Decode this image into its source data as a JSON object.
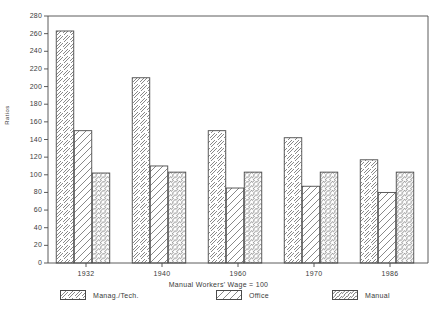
{
  "chart_data": {
    "type": "bar",
    "title": "",
    "xlabel": "Manual Workers' Wage = 100",
    "ylabel": "Ratios",
    "categories": [
      "1932",
      "1940",
      "1960",
      "1970",
      "1986"
    ],
    "series": [
      {
        "name": "Manag./Tech.",
        "pattern": "forward-diagonal",
        "values": [
          263,
          210,
          150,
          142,
          117
        ]
      },
      {
        "name": "Office",
        "pattern": "backward-diagonal",
        "values": [
          150,
          110,
          85,
          87,
          80
        ]
      },
      {
        "name": "Manual",
        "pattern": "dense-forward-diagonal",
        "values": [
          102,
          103,
          103,
          103,
          103
        ]
      }
    ],
    "ylim": [
      0,
      280
    ],
    "yticks": [
      0,
      20,
      40,
      60,
      80,
      100,
      120,
      140,
      160,
      180,
      200,
      220,
      240,
      260,
      280
    ],
    "ytick_labels": [
      "0",
      "20",
      "40",
      "60",
      "80",
      "100",
      "120",
      "140",
      "160",
      "180",
      "200",
      "220",
      "240",
      "260",
      "280"
    ],
    "grid": false,
    "legend_position": "bottom",
    "colors": {
      "axis": "#4a4a4a",
      "bar_outline": "#4a4a4a",
      "hatch": "#6b6b6b",
      "background": "#ffffff",
      "text": "#3a3a3a"
    }
  },
  "legend": {
    "items": [
      {
        "label": "Manag./Tech."
      },
      {
        "label": "Office"
      },
      {
        "label": "Manual"
      }
    ]
  }
}
